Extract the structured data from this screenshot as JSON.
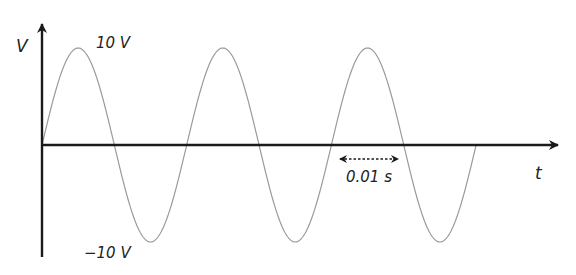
{
  "diagram": {
    "y_axis_label": "V",
    "x_axis_label": "t",
    "peak_label": "10 V",
    "trough_label": "−10 V",
    "period_annotation": "0.01 s",
    "colors": {
      "axis": "#1a1a1a",
      "wave": "#9a9a9a",
      "text": "#222222"
    }
  },
  "chart_data": {
    "type": "line",
    "title": "",
    "xlabel": "t",
    "ylabel": "V",
    "amplitude_V": 10,
    "period_s": 0.01,
    "cycles_shown": 3,
    "function": "V(t) = 10 sin(2π t / 0.01)",
    "annotations": [
      "10 V",
      "−10 V",
      "0.01 s (one period between zero crossings)"
    ],
    "ylim": [
      -10,
      10
    ],
    "grid": false
  }
}
